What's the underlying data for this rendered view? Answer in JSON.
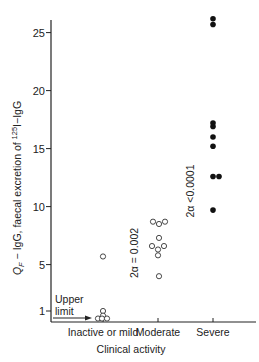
{
  "chart_data": {
    "type": "scatter",
    "title": "",
    "xlabel": "Clinical activity",
    "ylabel": {
      "main": "Q",
      "subscript": "F",
      "rest": " − IgG, faecal excretion of ",
      "superscript": "125",
      "isotope_rest": "I−IgG"
    },
    "ylabel_text": "QF − IgG, faecal excretion of 125I−IgG",
    "categories": [
      "Inactive or mild",
      "Moderate",
      "Severe"
    ],
    "yticks": [
      1,
      5,
      10,
      15,
      20,
      25
    ],
    "ylim": [
      0.3,
      26.5
    ],
    "grid": false,
    "series": [
      {
        "name": "Inactive or mild",
        "marker": "open-circle",
        "points": [
          {
            "dx": 0,
            "y": 5.7
          },
          {
            "dx": 0,
            "y": 1.0
          },
          {
            "dx": 0,
            "y": 0.6
          },
          {
            "dx": -5,
            "y": 0.35
          },
          {
            "dx": -1,
            "y": 0.35
          },
          {
            "dx": 4,
            "y": 0.35
          }
        ]
      },
      {
        "name": "Moderate",
        "marker": "open-circle",
        "points": [
          {
            "dx": -5,
            "y": 8.7
          },
          {
            "dx": 1,
            "y": 8.5
          },
          {
            "dx": 7,
            "y": 8.7
          },
          {
            "dx": 1,
            "y": 7.3
          },
          {
            "dx": -6,
            "y": 6.6
          },
          {
            "dx": 0,
            "y": 6.3
          },
          {
            "dx": 6,
            "y": 6.6
          },
          {
            "dx": 0,
            "y": 5.8
          },
          {
            "dx": 1,
            "y": 4.0
          }
        ]
      },
      {
        "name": "Severe",
        "marker": "filled-circle",
        "points": [
          {
            "dx": 0,
            "y": 26.2
          },
          {
            "dx": 0,
            "y": 25.7
          },
          {
            "dx": 0,
            "y": 17.2
          },
          {
            "dx": 0,
            "y": 16.9
          },
          {
            "dx": 0,
            "y": 16.0
          },
          {
            "dx": 0,
            "y": 15.2
          },
          {
            "dx": 0,
            "y": 12.6
          },
          {
            "dx": 6,
            "y": 12.6
          },
          {
            "dx": 0,
            "y": 9.7
          }
        ]
      }
    ],
    "annotations": [
      {
        "text": "2α = 0.002",
        "between": [
          "Inactive or mild",
          "Moderate"
        ],
        "rotation": -90
      },
      {
        "text": "2α <0.0001",
        "between": [
          "Moderate",
          "Severe"
        ],
        "rotation": -90
      },
      {
        "text": "Upper limit",
        "arrow": "right",
        "y": 0.9
      }
    ],
    "upper_limit_label": [
      "Upper",
      "limit"
    ]
  }
}
